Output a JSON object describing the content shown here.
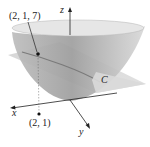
{
  "diagram": {
    "type": "3d-surface-plane-intersection",
    "surface": "paraboloid",
    "plane": "slanted plane",
    "curve_label": "C",
    "point_on_surface": {
      "label": "(2, 1, 7)"
    },
    "projection_point": {
      "label": "(2, 1)"
    },
    "axes": {
      "x": "x",
      "y": "y",
      "z": "z"
    },
    "colors": {
      "surface": "#c8c8c8",
      "surface_dark": "#9a9a9a",
      "plane": "#d6d6d6",
      "ink": "#222222"
    }
  }
}
